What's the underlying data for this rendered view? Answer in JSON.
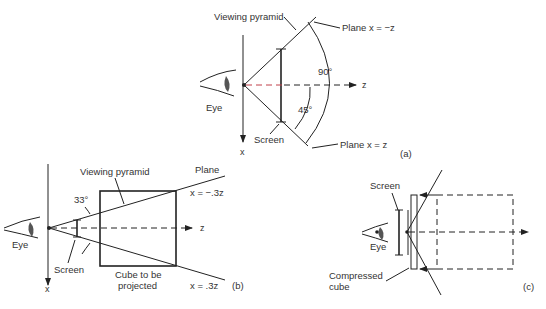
{
  "figure": {
    "panel_a": {
      "tag": "(a)",
      "labels": {
        "viewing_pyramid": "Viewing pyramid",
        "plane_top": "Plane x = −z",
        "plane_bottom": "Plane x = z",
        "eye": "Eye",
        "screen": "Screen",
        "angle_full": "90°",
        "angle_half": "45°",
        "z_axis": "z",
        "x_axis": "x"
      }
    },
    "panel_b": {
      "tag": "(b)",
      "labels": {
        "viewing_pyramid": "Viewing pyramid",
        "plane": "Plane",
        "plane_top": "x = −.3z",
        "plane_bottom": "x = .3z",
        "angle": "33°",
        "eye": "Eye",
        "screen": "Screen",
        "cube_line1": "Cube to be",
        "cube_line2": "projected",
        "z_axis": "z",
        "x_axis": "x"
      }
    },
    "panel_c": {
      "tag": "(c)",
      "labels": {
        "screen": "Screen",
        "eye": "Eye",
        "compressed_line1": "Compressed",
        "compressed_line2": "cube"
      }
    }
  }
}
